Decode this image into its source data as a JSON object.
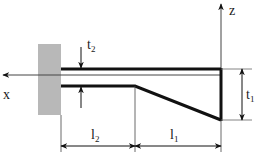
{
  "diagram": {
    "type": "tapered-cantilever-beam-cross-section",
    "colors": {
      "wall": "#b8b8b8",
      "line": "#111111",
      "thin_line": "#444444",
      "background": "#ffffff"
    },
    "axes": {
      "x": {
        "label": "x",
        "direction": "left"
      },
      "z": {
        "label": "z",
        "direction": "up"
      }
    },
    "dimensions": {
      "t2": {
        "main": "t",
        "sub": "2",
        "description": "flange/plate thickness at root"
      },
      "t1": {
        "main": "t",
        "sub": "1",
        "description": "depth at free end"
      },
      "l2": {
        "main": "l",
        "sub": "2",
        "description": "constant-section length"
      },
      "l1": {
        "main": "l",
        "sub": "1",
        "description": "tapered-section length"
      }
    }
  }
}
